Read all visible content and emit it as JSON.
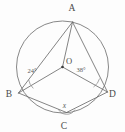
{
  "figure": {
    "type": "geometry-diagram",
    "background_color": "#fdfdfd",
    "stroke_color": "#6e6e6e",
    "circle": {
      "name": "circle-O",
      "center_label": "O",
      "center_x": 62.5,
      "center_y": 67,
      "radius": 46
    },
    "vertices": [
      {
        "id": "A",
        "label": "A",
        "x": 72.5,
        "y": 22.0,
        "label_x": 72.0,
        "label_y": 10.5
      },
      {
        "id": "B",
        "label": "B",
        "x": 18.5,
        "y": 93.0,
        "label_x": 9.0,
        "label_y": 97.0
      },
      {
        "id": "C",
        "label": "C",
        "x": 66.5,
        "y": 112.5,
        "label_x": 64.0,
        "label_y": 129.0
      },
      {
        "id": "D",
        "label": "D",
        "x": 107.5,
        "y": 92.0,
        "label_x": 112.5,
        "label_y": 96.5
      }
    ],
    "center_point": {
      "id": "O",
      "label": "O",
      "x": 62.5,
      "y": 67.0,
      "label_x": 66.0,
      "label_y": 64.0
    },
    "segments": [
      {
        "name": "segment-AB",
        "from": "A",
        "to": "B",
        "kind": "chord"
      },
      {
        "name": "segment-AD",
        "from": "A",
        "to": "D",
        "kind": "chord"
      },
      {
        "name": "segment-AO",
        "from": "A",
        "to": "O",
        "kind": "radius"
      },
      {
        "name": "segment-OB",
        "from": "O",
        "to": "B",
        "kind": "radius"
      },
      {
        "name": "segment-OD",
        "from": "O",
        "to": "D",
        "kind": "radius"
      },
      {
        "name": "segment-BC",
        "from": "B",
        "to": "C",
        "kind": "chord"
      },
      {
        "name": "segment-CD",
        "from": "C",
        "to": "D",
        "kind": "chord"
      }
    ],
    "angles": [
      {
        "id": "angle-B",
        "vertex": "B",
        "label": "24°",
        "value": 24,
        "unit": "degrees",
        "label_x": 32.0,
        "label_y": 72.5,
        "known": true
      },
      {
        "id": "angle-D",
        "vertex": "D",
        "label": "38°",
        "value": 38,
        "unit": "degrees",
        "label_x": 81.0,
        "label_y": 72.0,
        "known": true
      },
      {
        "id": "angle-C",
        "vertex": "C",
        "label": "x",
        "value": null,
        "unit": "degrees",
        "label_x": 64.5,
        "label_y": 107.5,
        "known": false
      }
    ]
  }
}
